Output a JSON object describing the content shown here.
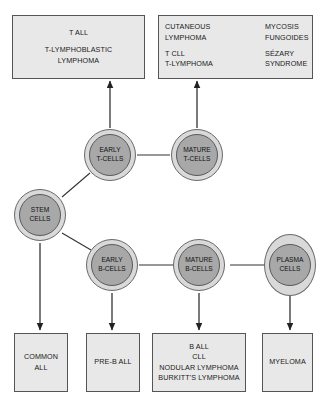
{
  "diagram": {
    "colors": {
      "box_fill": "#e8e8e8",
      "box_border": "#555555",
      "node_outer_fill": "#d9d9d9",
      "node_inner_fill": "#a8a8a8",
      "connector": "#333333",
      "background": "#ffffff"
    },
    "top_boxes": {
      "t_all": {
        "line1": "T ALL",
        "line2": "T-LYMPHOBLASTIC",
        "line3": "LYMPHOMA"
      },
      "cutaneous": {
        "left_line1": "CUTANEOUS",
        "left_line2": "LYMPHOMA",
        "left_line3": "T CLL",
        "left_line4": "T-LYMPHOMA",
        "right_line1": "MYCOSIS",
        "right_line2": "FUNGOIDES",
        "right_line3": "SÉZARY",
        "right_line4": "SYNDROME"
      }
    },
    "nodes": {
      "stem": {
        "line1": "STEM",
        "line2": "CELLS"
      },
      "early_t": {
        "line1": "EARLY",
        "line2": "T-CELLS"
      },
      "mature_t": {
        "line1": "MATURE",
        "line2": "T-CELLS"
      },
      "early_b": {
        "line1": "EARLY",
        "line2": "B-CELLS"
      },
      "mature_b": {
        "line1": "MATURE",
        "line2": "B-CELLS"
      },
      "plasma": {
        "line1": "PLASMA",
        "line2": "CELLS"
      }
    },
    "bottom_boxes": {
      "common_all": {
        "line1": "COMMON",
        "line2": "ALL"
      },
      "pre_b_all": {
        "line1": "PRE-B ALL"
      },
      "b_cell_neoplasms": {
        "line1": "B ALL",
        "line2": "CLL",
        "line3": "NODULAR LYMPHOMA",
        "line4": "BURKITT'S LYMPHOMA"
      },
      "myeloma": {
        "line1": "MYELOMA"
      }
    }
  }
}
